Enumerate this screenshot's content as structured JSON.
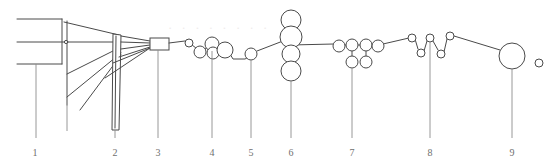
{
  "figure": {
    "width": 548,
    "height": 166,
    "background_color": "#ffffff",
    "line_color": "#4a4a4a",
    "leader_color": "#8d8d8d",
    "label_color": "#6f6f6f",
    "watermark_color": "#f0ecec",
    "watermark_text": "· · · · · · · ·"
  },
  "callouts": [
    {
      "number": "1",
      "x": 35,
      "label_y": 148,
      "leader_top": 63,
      "leader_bottom": 138
    },
    {
      "number": "2",
      "x": 115,
      "label_y": 148,
      "leader_top": 92,
      "leader_bottom": 138
    },
    {
      "number": "3",
      "x": 158,
      "label_y": 148,
      "leader_top": 50,
      "leader_bottom": 138
    },
    {
      "number": "4",
      "x": 212,
      "label_y": 148,
      "leader_top": 52,
      "leader_bottom": 138
    },
    {
      "number": "5",
      "x": 250,
      "label_y": 148,
      "leader_top": 60,
      "leader_bottom": 138
    },
    {
      "number": "6",
      "x": 291,
      "label_y": 148,
      "leader_top": 76,
      "leader_bottom": 138
    },
    {
      "number": "7",
      "x": 352,
      "label_y": 148,
      "leader_top": 52,
      "leader_bottom": 138
    },
    {
      "number": "8",
      "x": 430,
      "label_y": 148,
      "leader_top": 45,
      "leader_bottom": 138
    },
    {
      "number": "9",
      "x": 512,
      "label_y": 148,
      "leader_top": 68,
      "leader_bottom": 138
    }
  ],
  "geometry": {
    "left_frame": {
      "horizontal_rails": [
        {
          "x1": 17,
          "y1": 19,
          "x2": 62,
          "y2": 19
        },
        {
          "x1": 17,
          "y1": 42,
          "x2": 68,
          "y2": 42
        },
        {
          "x1": 17,
          "y1": 64,
          "x2": 62,
          "y2": 64
        }
      ],
      "verticals": [
        {
          "x1": 62,
          "y1": 19,
          "x2": 62,
          "y2": 64
        },
        {
          "x1": 67,
          "y1": 21,
          "x2": 67,
          "y2": 105
        },
        {
          "x1": 36,
          "y1": 64,
          "x2": 36,
          "y2": 138
        }
      ],
      "guy_wires": [
        {
          "x1": 64,
          "y1": 22,
          "x2": 119,
          "y2": 35
        },
        {
          "x1": 68,
          "y1": 42,
          "x2": 119,
          "y2": 42
        },
        {
          "x1": 67,
          "y1": 74,
          "x2": 119,
          "y2": 48
        },
        {
          "x1": 67,
          "y1": 97,
          "x2": 119,
          "y2": 53
        },
        {
          "x1": 62,
          "y1": 19,
          "x2": 62,
          "y2": 64
        }
      ],
      "small_node": {
        "cx": 66,
        "cy": 42,
        "r": 1.6
      }
    },
    "tower": {
      "x": 111,
      "y": 34,
      "width": 8,
      "height": 96,
      "top_skew": 2
    },
    "fan_lines": [
      {
        "x1": 119,
        "y1": 36,
        "x2": 151,
        "y2": 42
      },
      {
        "x1": 119,
        "y1": 42,
        "x2": 151,
        "y2": 44
      },
      {
        "x1": 119,
        "y1": 48,
        "x2": 151,
        "y2": 45
      },
      {
        "x1": 119,
        "y1": 55,
        "x2": 151,
        "y2": 46
      },
      {
        "x1": 113,
        "y1": 60,
        "x2": 151,
        "y2": 46
      },
      {
        "x1": 108,
        "y1": 74,
        "x2": 151,
        "y2": 46
      }
    ],
    "junction_box": {
      "x": 150,
      "y": 38,
      "width": 19,
      "height": 12
    },
    "rollers": [
      {
        "id": "r1",
        "cx": 189,
        "cy": 43,
        "r": 4
      },
      {
        "id": "r2",
        "cx": 200,
        "cy": 52,
        "r": 6
      },
      {
        "id": "r3",
        "cx": 212,
        "cy": 44,
        "r": 7
      },
      {
        "id": "r4",
        "cx": 224,
        "cy": 50,
        "r": 8
      },
      {
        "id": "r5",
        "cx": 223,
        "cy": 52,
        "r": 6
      },
      {
        "id": "r6",
        "cx": 251,
        "cy": 54,
        "r": 6
      },
      {
        "id": "r7",
        "cx": 291,
        "cy": 20,
        "r": 10
      },
      {
        "id": "r8",
        "cx": 291,
        "cy": 37,
        "r": 11
      },
      {
        "id": "r9",
        "cx": 291,
        "cy": 54,
        "r": 9
      },
      {
        "id": "r10",
        "cx": 291,
        "cy": 71,
        "r": 10
      },
      {
        "id": "r11",
        "cx": 339,
        "cy": 46,
        "r": 6
      },
      {
        "id": "r12",
        "cx": 352,
        "cy": 45,
        "r": 6
      },
      {
        "id": "r13",
        "cx": 352,
        "cy": 62,
        "r": 6
      },
      {
        "id": "r14",
        "cx": 366,
        "cy": 45,
        "r": 6
      },
      {
        "id": "r15",
        "cx": 366,
        "cy": 62,
        "r": 6
      },
      {
        "id": "r16",
        "cx": 377,
        "cy": 46,
        "r": 6
      },
      {
        "id": "r17",
        "cx": 412,
        "cy": 38,
        "r": 4
      },
      {
        "id": "r18",
        "cx": 421,
        "cy": 53,
        "r": 4
      },
      {
        "id": "r19",
        "cx": 430,
        "cy": 39,
        "r": 4
      },
      {
        "id": "r20",
        "cx": 441,
        "cy": 54,
        "r": 4
      },
      {
        "id": "r21",
        "cx": 450,
        "cy": 36,
        "r": 4
      },
      {
        "id": "r22",
        "cx": 512,
        "cy": 56,
        "r": 13
      },
      {
        "id": "r23",
        "cx": 539,
        "cy": 63,
        "r": 4
      }
    ],
    "web_path": "M 169 43 L 185 41 M 193 44 L 196 47 M 205 51 L 206 49 M 218 45 L 219 46 M 231 52 L 233 59 L 245 59 L 247 57 M 256 51 L 282 41 M 300 38 L 334 44 M 344 45 L 347 45 M 357 45 L 361 45 M 371 45 L 372 45 M 383 45 L 409 39 M 415 36 L 418 49 M 424 50 L 427 40 M 434 40 L 438 50 M 444 51 L 447 39 M 454 36 L 500 50 M 512 69 L 512 138",
    "connector_segments": [
      {
        "x1": 233,
        "y1": 59,
        "x2": 245,
        "y2": 59
      },
      {
        "x1": 352,
        "y1": 56,
        "x2": 352,
        "y2": 51
      },
      {
        "x1": 366,
        "y1": 56,
        "x2": 366,
        "y2": 51
      },
      {
        "x1": 291,
        "y1": 45,
        "x2": 334,
        "y2": 44
      }
    ]
  },
  "labels": {
    "one": "1",
    "two": "2",
    "three": "3",
    "four": "4",
    "five": "5",
    "six": "6",
    "seven": "7",
    "eight": "8",
    "nine": "9"
  }
}
